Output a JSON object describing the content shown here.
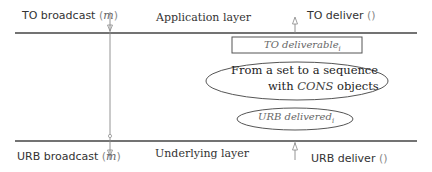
{
  "diagram": {
    "top_layer": {
      "title": "Application layer",
      "left_label": "TO broadcast",
      "left_arg": "m",
      "right_label": "TO deliver",
      "right_arg": "()"
    },
    "bottom_layer": {
      "title": "Underlying layer",
      "left_label": "URB broadcast",
      "left_arg": "m",
      "right_label": "URB deliver",
      "right_arg": "()"
    },
    "box": {
      "label": "TO deliverable",
      "subscript": "i"
    },
    "big_ellipse": {
      "line1": "From a set to a sequence",
      "line2_prefix": "with ",
      "line2_italic": "CONS",
      "line2_suffix": " objects"
    },
    "small_ellipse": {
      "label": "URB delivered",
      "subscript": "i"
    },
    "colors": {
      "line": "#444444",
      "arrow": "#888888",
      "text": "#333333",
      "italic_text": "#666666"
    }
  }
}
